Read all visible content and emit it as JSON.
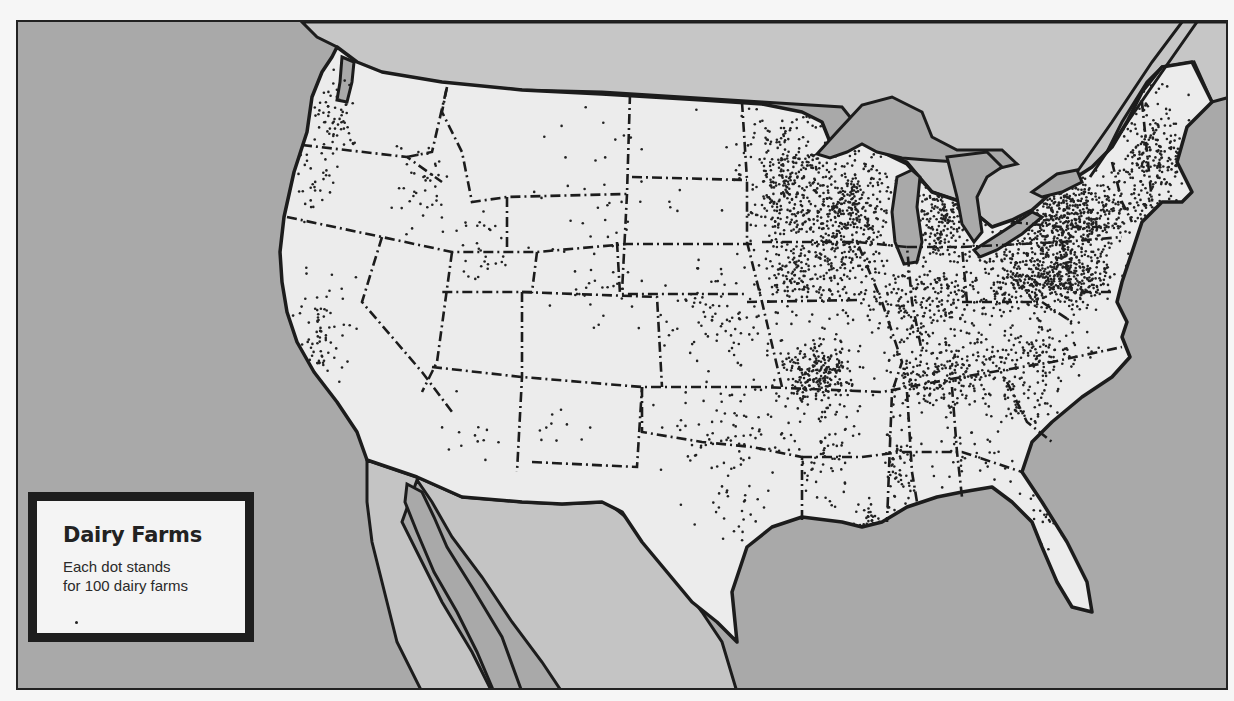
{
  "map": {
    "subject": "Dairy farm distribution in the contiguous United States (dot density map)",
    "colors": {
      "ocean": "#a9a9a9",
      "canada_land": "#c6c6c6",
      "mexico_land": "#c4c4c4",
      "us_land": "#ececec",
      "lakes": "#a9a9a9",
      "outline": "#1c1c1c",
      "dot": "#222222"
    }
  },
  "legend": {
    "title": "Dairy Farms",
    "description_line1": "Each dot stands",
    "description_line2": "for 100 dairy farms",
    "dot_value": 100
  },
  "dot_clusters": [
    {
      "name": "Washington west",
      "cx": 335,
      "cy": 115,
      "rx": 18,
      "ry": 30,
      "n": 60
    },
    {
      "name": "Oregon west",
      "cx": 310,
      "cy": 175,
      "rx": 20,
      "ry": 30,
      "n": 30
    },
    {
      "name": "Idaho",
      "cx": 420,
      "cy": 180,
      "rx": 22,
      "ry": 40,
      "n": 40
    },
    {
      "name": "Utah",
      "cx": 480,
      "cy": 250,
      "rx": 30,
      "ry": 40,
      "n": 30
    },
    {
      "name": "California central",
      "cx": 318,
      "cy": 335,
      "rx": 22,
      "ry": 50,
      "n": 70
    },
    {
      "name": "Colorado",
      "cx": 600,
      "cy": 300,
      "rx": 30,
      "ry": 25,
      "n": 20
    },
    {
      "name": "Arizona",
      "cx": 470,
      "cy": 430,
      "rx": 25,
      "ry": 20,
      "n": 12
    },
    {
      "name": "New Mexico",
      "cx": 560,
      "cy": 430,
      "rx": 35,
      "ry": 30,
      "n": 10
    },
    {
      "name": "Great Plains west",
      "cx": 600,
      "cy": 200,
      "rx": 70,
      "ry": 60,
      "n": 45
    },
    {
      "name": "Minnesota",
      "cx": 785,
      "cy": 175,
      "rx": 38,
      "ry": 55,
      "n": 320
    },
    {
      "name": "Wisconsin",
      "cx": 845,
      "cy": 210,
      "rx": 38,
      "ry": 50,
      "n": 420
    },
    {
      "name": "Iowa",
      "cx": 800,
      "cy": 270,
      "rx": 40,
      "ry": 30,
      "n": 170
    },
    {
      "name": "Michigan",
      "cx": 940,
      "cy": 215,
      "rx": 25,
      "ry": 40,
      "n": 170
    },
    {
      "name": "Illinois Indiana Ohio",
      "cx": 920,
      "cy": 300,
      "rx": 70,
      "ry": 40,
      "n": 300
    },
    {
      "name": "New York",
      "cx": 1060,
      "cy": 215,
      "rx": 55,
      "ry": 35,
      "n": 500
    },
    {
      "name": "Pennsylvania",
      "cx": 1050,
      "cy": 275,
      "rx": 55,
      "ry": 28,
      "n": 520
    },
    {
      "name": "New England",
      "cx": 1150,
      "cy": 160,
      "rx": 35,
      "ry": 55,
      "n": 240
    },
    {
      "name": "Missouri",
      "cx": 815,
      "cy": 370,
      "rx": 30,
      "ry": 30,
      "n": 260
    },
    {
      "name": "Kansas Nebraska",
      "cx": 720,
      "cy": 310,
      "rx": 45,
      "ry": 40,
      "n": 90
    },
    {
      "name": "Kentucky Tennessee",
      "cx": 950,
      "cy": 375,
      "rx": 60,
      "ry": 25,
      "n": 250
    },
    {
      "name": "Virginia",
      "cx": 1040,
      "cy": 350,
      "rx": 40,
      "ry": 25,
      "n": 110
    },
    {
      "name": "Oklahoma Texas north",
      "cx": 720,
      "cy": 430,
      "rx": 55,
      "ry": 40,
      "n": 80
    },
    {
      "name": "Texas central",
      "cx": 740,
      "cy": 510,
      "rx": 40,
      "ry": 40,
      "n": 30
    },
    {
      "name": "Arkansas Louisiana",
      "cx": 820,
      "cy": 440,
      "rx": 30,
      "ry": 50,
      "n": 70
    },
    {
      "name": "Mississippi",
      "cx": 895,
      "cy": 460,
      "rx": 14,
      "ry": 40,
      "n": 60
    },
    {
      "name": "Louisiana southeast",
      "cx": 870,
      "cy": 520,
      "rx": 14,
      "ry": 12,
      "n": 25
    },
    {
      "name": "Alabama Georgia",
      "cx": 970,
      "cy": 450,
      "rx": 50,
      "ry": 40,
      "n": 45
    },
    {
      "name": "Carolinas",
      "cx": 1030,
      "cy": 400,
      "rx": 40,
      "ry": 25,
      "n": 50
    },
    {
      "name": "Florida",
      "cx": 1040,
      "cy": 520,
      "rx": 25,
      "ry": 35,
      "n": 15
    }
  ]
}
